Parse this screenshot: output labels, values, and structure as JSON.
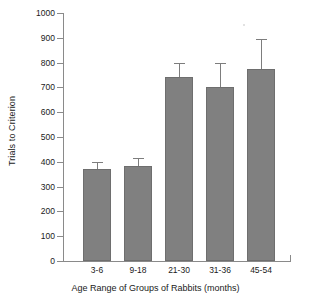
{
  "chart_data": {
    "type": "bar",
    "title": "",
    "xlabel": "Age Range of Groups of Rabbits (months)",
    "ylabel": "Trials to Criterion",
    "categories": [
      "3-6",
      "9-18",
      "21-30",
      "31-36",
      "45-54"
    ],
    "values": [
      372,
      385,
      740,
      700,
      775
    ],
    "errors_upper": [
      400,
      417,
      800,
      800,
      895
    ],
    "error_bars": [
      28,
      32,
      60,
      100,
      120
    ],
    "ylim": [
      0,
      1000
    ],
    "ytick_labels": [
      "1000",
      "900",
      "800",
      "700",
      "600",
      "500",
      "400",
      "300",
      "200",
      "100",
      "0"
    ],
    "ytick_values": [
      1000,
      900,
      800,
      700,
      600,
      500,
      400,
      300,
      200,
      100,
      0
    ],
    "grid": false,
    "legend": null,
    "bar_color": "#808080",
    "axis_color": "#8a8a8a",
    "text_color": "#1a1a1a"
  }
}
